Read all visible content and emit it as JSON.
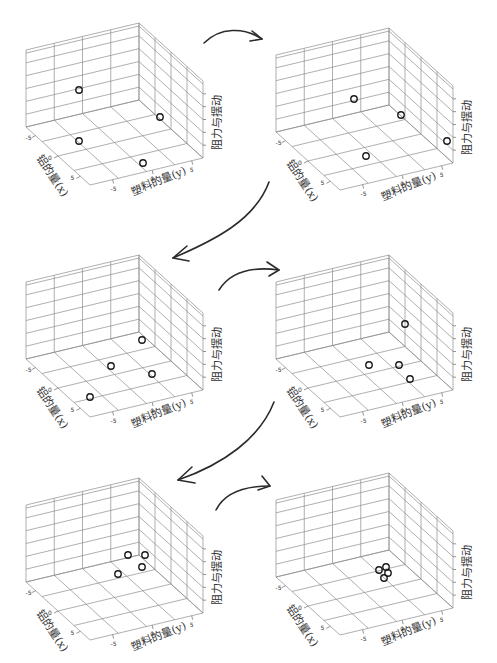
{
  "axes": {
    "x_label": "铝的量(x)",
    "y_label": "塑料的量(y)",
    "z_label": "阻力与摆动",
    "x_ticks": [
      "-5",
      "0",
      "5"
    ],
    "y_ticks": [
      "-5",
      "0",
      "5"
    ]
  },
  "geometry": {
    "B": [
      139,
      100
    ],
    "L": [
      26,
      127
    ],
    "R": [
      203,
      158
    ],
    "H": 77,
    "left_cols": 4,
    "right_cols": 4,
    "floor_left_div": 4,
    "floor_right_div": 4,
    "z_rows": 6
  },
  "panels": [
    {
      "id": "step-1",
      "left": 0,
      "top": 0,
      "points": [
        [
          79,
          90
        ],
        [
          160,
          117
        ],
        [
          79,
          141
        ],
        [
          143,
          163
        ]
      ]
    },
    {
      "id": "step-2",
      "left": 250,
      "top": 5,
      "points": [
        [
          104,
          94
        ],
        [
          151,
          110
        ],
        [
          197,
          136
        ],
        [
          116,
          151
        ]
      ]
    },
    {
      "id": "step-3",
      "left": 0,
      "top": 232,
      "points": [
        [
          142,
          108
        ],
        [
          111,
          134
        ],
        [
          152,
          142
        ],
        [
          90,
          165
        ]
      ]
    },
    {
      "id": "step-4",
      "left": 250,
      "top": 232,
      "points": [
        [
          155,
          92
        ],
        [
          119,
          133
        ],
        [
          149,
          133
        ],
        [
          160,
          147
        ]
      ]
    },
    {
      "id": "step-5",
      "left": 0,
      "top": 455,
      "points": [
        [
          128,
          100
        ],
        [
          145,
          100
        ],
        [
          142,
          112
        ],
        [
          118,
          119
        ]
      ]
    },
    {
      "id": "step-6",
      "left": 250,
      "top": 450,
      "points": [
        [
          129,
          120
        ],
        [
          136,
          117
        ],
        [
          138,
          123
        ],
        [
          134,
          128
        ]
      ]
    }
  ],
  "chart_data": {
    "type": "scatter",
    "title": "",
    "xlabel": "铝的量(x)",
    "ylabel": "塑料的量(y)",
    "zlabel": "阻力与摆动",
    "xlim": [
      -5,
      5
    ],
    "ylim": [
      -5,
      5
    ],
    "x_ticks": [
      -5,
      0,
      5
    ],
    "y_ticks": [
      -5,
      0,
      5
    ],
    "grid": true,
    "series": [
      {
        "name": "step 1",
        "points_approx": [
          [
            -3,
            -1,
            3
          ],
          [
            3,
            3,
            2
          ],
          [
            -1,
            -4,
            0
          ],
          [
            3,
            -1,
            0
          ]
        ]
      },
      {
        "name": "step 2",
        "points_approx": [
          [
            -2,
            0,
            2
          ],
          [
            1,
            3,
            2
          ],
          [
            4,
            3,
            1
          ],
          [
            0,
            -3,
            0
          ]
        ]
      },
      {
        "name": "step 3",
        "points_approx": [
          [
            2,
            3,
            1
          ],
          [
            -1,
            0,
            0
          ],
          [
            2,
            1,
            0
          ],
          [
            -2,
            -3,
            0
          ]
        ]
      },
      {
        "name": "step 4",
        "points_approx": [
          [
            3,
            4,
            2
          ],
          [
            -1,
            0,
            0
          ],
          [
            1,
            1,
            0
          ],
          [
            2,
            0,
            0
          ]
        ]
      },
      {
        "name": "step 5",
        "points_approx": [
          [
            0,
            1,
            0
          ],
          [
            1,
            2,
            0
          ],
          [
            1,
            1,
            0
          ],
          [
            0,
            0,
            0
          ]
        ]
      },
      {
        "name": "step 6",
        "points_approx": [
          [
            0,
            0,
            0
          ],
          [
            0,
            0,
            0
          ],
          [
            0,
            0,
            0
          ],
          [
            0,
            0,
            0
          ]
        ]
      }
    ]
  },
  "arrows": [
    {
      "id": "arrow-1-to-2",
      "left": 200,
      "top": 25,
      "d": "M 4 18 C 20 2, 44 2, 62 14",
      "head": "M 52 6 L 62 14 L 50 16"
    },
    {
      "id": "arrow-2-to-3",
      "left": 165,
      "top": 180,
      "d": "M 104 2 C 90 40, 50 60, 8 78",
      "head": "M 22 66 L 8 78 L 24 81"
    },
    {
      "id": "arrow-3-to-4",
      "left": 215,
      "top": 262,
      "d": "M 4 28 C 14 12, 34 4, 64 8",
      "head": "M 52 0 L 64 8 L 54 14"
    },
    {
      "id": "arrow-4-to-5",
      "left": 168,
      "top": 400,
      "d": "M 106 2 C 92 38, 56 64, 10 80",
      "head": "M 24 67 L 10 80 L 27 83"
    },
    {
      "id": "arrow-5-to-6",
      "left": 212,
      "top": 480,
      "d": "M 4 30 C 12 14, 30 6, 58 6",
      "head": "M 50 -4 L 58 6 L 46 10"
    }
  ]
}
